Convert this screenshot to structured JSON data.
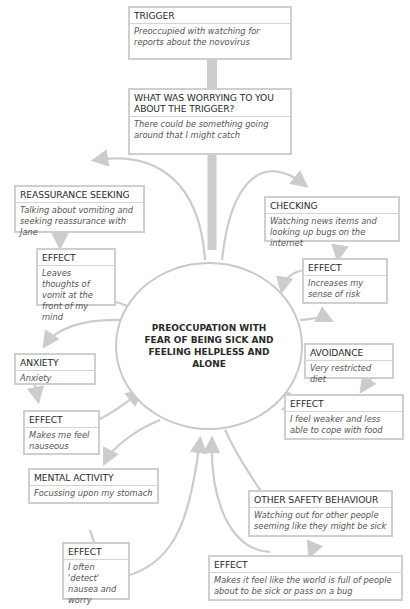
{
  "center": {
    "label": "PREOCCUPATION WITH FEAR OF BEING SICK AND FEELING HELPLESS AND ALONE"
  },
  "boxes": {
    "trigger": {
      "title": "TRIGGER",
      "text": "Preoccupied with watching for reports about the novovirus"
    },
    "worry": {
      "title": "WHAT WAS WORRYING TO YOU ABOUT THE TRIGGER?",
      "text": "There could be something going around that I might catch"
    },
    "reassurance": {
      "title": "REASSURANCE SEEKING",
      "text": "Talking about vomiting and seeking reassurance with Jane"
    },
    "reassurance_effect": {
      "title": "EFFECT",
      "text": "Leaves thoughts of vomit at the front of my mind"
    },
    "checking": {
      "title": "CHECKING",
      "text": "Watching news items and looking up bugs on the internet"
    },
    "checking_effect": {
      "title": "EFFECT",
      "text": "Increases my sense of risk"
    },
    "avoidance": {
      "title": "AVOIDANCE",
      "text": "Very restricted diet"
    },
    "avoidance_effect": {
      "title": "EFFECT",
      "text": "I feel weaker and less able to cope with food"
    },
    "anxiety": {
      "title": "ANXIETY",
      "text": "Anxiety"
    },
    "anxiety_effect": {
      "title": "EFFECT",
      "text": "Makes me feel nauseous"
    },
    "mental": {
      "title": "MENTAL ACTIVITY",
      "text": "Focussing upon my stomach"
    },
    "mental_effect": {
      "title": "EFFECT",
      "text": "I often 'detect' nausea and worry"
    },
    "safety": {
      "title": "OTHER SAFETY BEHAVIOUR",
      "text": "Watching out for other people seeming like they might be sick"
    },
    "safety_effect": {
      "title": "EFFECT",
      "text": "Makes it feel like the world is full of people about to be sick or pass on a bug"
    }
  },
  "colors": {
    "border": "#cfcfcf",
    "arrow": "#cccccc",
    "text": "#2b2b2b"
  }
}
